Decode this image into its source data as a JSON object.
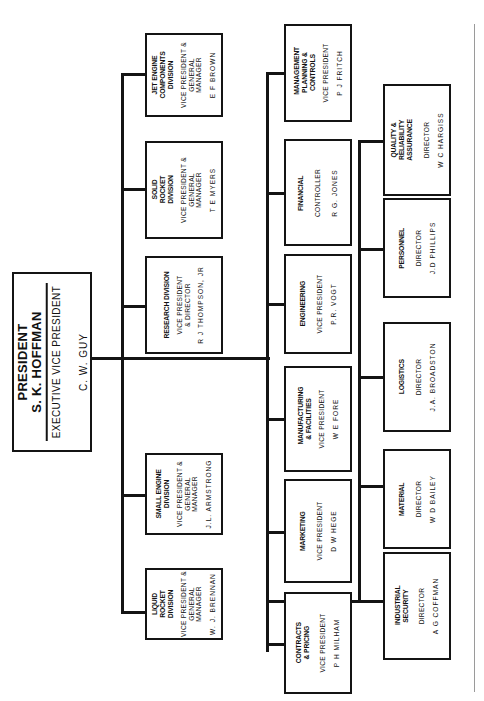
{
  "chart_orientation": "rotated 90 degrees counter-clockwise",
  "top": {
    "title": "PRESIDENT",
    "president": "S. K. HOFFMAN",
    "exec_role": "EXECUTIVE VICE PRESIDENT",
    "exec_vp": "C. W. GUY"
  },
  "divisions": [
    {
      "title": "JET ENGINE COMPONENTS DIVISION",
      "role": "VICE PRESIDENT & GENERAL MANAGER",
      "person": "E F BROWN"
    },
    {
      "title": "SOLID ROCKET DIVISION",
      "role": "VICE PRESIDENT & GENERAL MANAGER",
      "person": "T E MYERS"
    },
    {
      "title": "RESEARCH DIVISION",
      "role": "VICE PRESIDENT & DIRECTOR",
      "person": "R J THOMPSON, JR"
    },
    {
      "title": "SMALL ENGINE DIVISION",
      "role": "VICE PRESIDENT & GENERAL MANAGER",
      "person": "J.L. ARMSTRONG"
    },
    {
      "title": "LIQUID ROCKET DIVISION",
      "role": "VICE PRESIDENT & GENERAL MANAGER",
      "person": "W. J. BRENNAN"
    }
  ],
  "staff_vps": [
    {
      "title": "MANAGEMENT PLANNING & CONTROLS",
      "role": "VICE PRESIDENT",
      "person": "P J FRITCH"
    },
    {
      "title": "FINANCIAL",
      "role": "CONTROLLER",
      "person": "R G. JONES"
    },
    {
      "title": "ENGINEERING",
      "role": "VICE PRESIDENT",
      "person": "P.R. VOGT"
    },
    {
      "title": "MANUFACTURING & FACILITIES",
      "role": "VICE PRESIDENT",
      "person": "W E FORE"
    },
    {
      "title": "MARKETING",
      "role": "VICE PRESIDENT",
      "person": "D W HEGE"
    },
    {
      "title": "CONTRACTS & PRICING",
      "role": "VICE PRESIDENT",
      "person": "P H MILHAM"
    }
  ],
  "directors": [
    {
      "title": "QUALITY & RELIABILITY ASSURANCE",
      "role": "DIRECTOR",
      "person": "W C HARGISS"
    },
    {
      "title": "PERSONNEL",
      "role": "DIRECTOR",
      "person": "J.D PHILLIPS"
    },
    {
      "title": "LOGISTICS",
      "role": "DIRECTOR",
      "person": "J.A. BROADSTON"
    },
    {
      "title": "MATERIAL",
      "role": "DIRECTOR",
      "person": "W D BAILEY"
    },
    {
      "title": "INDUSTRIAL SECURITY",
      "role": "DIRECTOR",
      "person": "A G COFFMAN"
    }
  ],
  "colors": {
    "ink": "#141414",
    "paper": "#ffffff",
    "border": "#9a9a9a"
  }
}
